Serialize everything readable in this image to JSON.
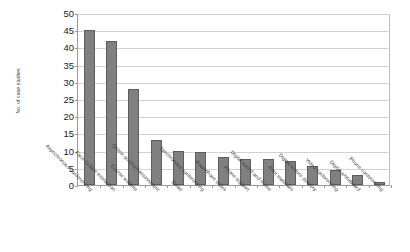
{
  "chart_data": {
    "type": "bar",
    "title": "",
    "xlabel": "",
    "ylabel": "No. of case studies",
    "ylim": [
      0,
      50
    ],
    "yticks": [
      0,
      5,
      10,
      15,
      20,
      25,
      30,
      35,
      40,
      45,
      50
    ],
    "grid": true,
    "legend": "none",
    "orientation": "vertical",
    "bar_color": "#808080",
    "bar_edge_color": "#5d5d5d",
    "categories": [
      "Asynchronous conferencing",
      "Face-to-face interaction",
      "Course website",
      "Online quiz/self-assessment",
      "Email",
      "Synchronous conferencing",
      "PowerPoint slides",
      "Phone support",
      "Digital sound and movie",
      "Print materials",
      "Digital lecture delivery",
      "Video conferencing",
      "Digital whiteboard",
      "Phone conferencing"
    ],
    "values": [
      45,
      42,
      28,
      13,
      10,
      9.5,
      8,
      7.5,
      7.5,
      7,
      5.5,
      4.5,
      3,
      1
    ]
  }
}
